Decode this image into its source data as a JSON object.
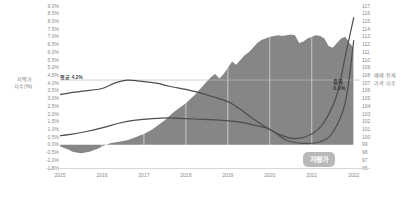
{
  "chart_data": {
    "type": "area",
    "title": "",
    "subtitle": "",
    "xlabel": "",
    "ylabel": "저평가 지수(%)",
    "y2label": "매매·전세\n가격·지수",
    "grid": true,
    "legend_position": "none",
    "x_tick_labels": [
      "2015",
      "2016",
      "2017",
      "2018",
      "2019",
      "2020",
      "2021",
      "2022"
    ],
    "ylim": [
      -1.5,
      9.0
    ],
    "y_tick_labels": [
      "9.0%",
      "8.5%",
      "8.0%",
      "7.5%",
      "7.0%",
      "6.5%",
      "6.0%",
      "5.5%",
      "5.0%",
      "4.5%",
      "4.0%",
      "3.5%",
      "3.0%",
      "2.5%",
      "2.0%",
      "1.5%",
      "1.0%",
      "0.5%",
      "0.0%",
      "-0.5%",
      "-1.0%",
      "-1.5%"
    ],
    "y_tick_values": [
      9.0,
      8.5,
      8.0,
      7.5,
      7.0,
      6.5,
      6.0,
      5.5,
      5.0,
      4.5,
      4.0,
      3.5,
      3.0,
      2.5,
      2.0,
      1.5,
      1.0,
      0.5,
      0.0,
      -0.5,
      -1.0,
      -1.5
    ],
    "y2lim": [
      96,
      117
    ],
    "y2_tick_labels": [
      "117",
      "116",
      "115",
      "114",
      "113",
      "112",
      "111",
      "110",
      "109",
      "108",
      "107",
      "106",
      "105",
      "104",
      "103",
      "102",
      "101",
      "100",
      "99",
      "98",
      "97",
      "96"
    ],
    "y2_tick_values": [
      117,
      116,
      115,
      114,
      113,
      112,
      111,
      110,
      109,
      108,
      107,
      106,
      105,
      104,
      103,
      102,
      101,
      100,
      99,
      98,
      97,
      96
    ],
    "annotations": [
      {
        "name": "average-line-label",
        "text": "평균 4.2%",
        "value": 4.2,
        "axis": "left"
      },
      {
        "name": "peak-label",
        "text": "중복 3.0%",
        "value": 3.0,
        "axis": "left"
      },
      {
        "name": "undervalued-badge",
        "text": "저평가"
      }
    ],
    "series": [
      {
        "name": "저평가 지수",
        "type": "area",
        "axis": "left",
        "color": "#808080",
        "x": [
          2015.0,
          2015.1,
          2015.2,
          2015.3,
          2015.4,
          2015.5,
          2015.6,
          2015.7,
          2015.8,
          2015.9,
          2016.0,
          2016.1,
          2016.2,
          2016.3,
          2016.4,
          2016.5,
          2016.6,
          2016.7,
          2016.8,
          2016.9,
          2017.0,
          2017.1,
          2017.2,
          2017.3,
          2017.4,
          2017.5,
          2017.6,
          2017.7,
          2017.8,
          2017.9,
          2018.0,
          2018.1,
          2018.2,
          2018.3,
          2018.4,
          2018.5,
          2018.6,
          2018.7,
          2018.8,
          2018.9,
          2019.0,
          2019.1,
          2019.2,
          2019.3,
          2019.4,
          2019.5,
          2019.6,
          2019.7,
          2019.8,
          2019.9,
          2020.0,
          2020.1,
          2020.2,
          2020.3,
          2020.4,
          2020.5,
          2020.6,
          2020.7,
          2020.8,
          2020.9,
          2021.0,
          2021.1,
          2021.2,
          2021.3,
          2021.4,
          2021.5,
          2021.6,
          2021.7,
          2021.8,
          2021.9,
          2022.0
        ],
        "values": [
          -0.1,
          -0.2,
          -0.3,
          -0.45,
          -0.5,
          -0.55,
          -0.5,
          -0.45,
          -0.35,
          -0.25,
          -0.1,
          0.0,
          0.1,
          0.15,
          0.2,
          0.25,
          0.3,
          0.4,
          0.5,
          0.6,
          0.7,
          0.85,
          1.0,
          1.2,
          1.4,
          1.6,
          1.85,
          2.1,
          2.3,
          2.5,
          2.7,
          2.95,
          3.2,
          3.5,
          3.8,
          4.1,
          4.4,
          4.6,
          4.3,
          4.6,
          5.0,
          5.4,
          5.2,
          5.5,
          5.8,
          6.0,
          6.3,
          6.6,
          6.8,
          6.9,
          7.0,
          7.05,
          7.1,
          7.05,
          7.1,
          7.15,
          7.1,
          6.6,
          6.7,
          6.9,
          7.0,
          7.1,
          7.05,
          6.9,
          6.4,
          6.3,
          6.6,
          6.9,
          7.0,
          6.6,
          6.3
        ]
      },
      {
        "name": "매매가격지수",
        "type": "line",
        "axis": "right",
        "color": "#4d4d4d",
        "x": [
          2015.0,
          2015.3,
          2015.6,
          2016.0,
          2016.3,
          2016.6,
          2017.0,
          2017.3,
          2017.6,
          2018.0,
          2018.3,
          2018.6,
          2019.0,
          2019.3,
          2019.6,
          2020.0,
          2020.3,
          2020.6,
          2021.0,
          2021.3,
          2021.6,
          2021.8,
          2022.0
        ],
        "values": [
          105.5,
          105.8,
          106.0,
          106.3,
          107.0,
          107.4,
          107.2,
          107.0,
          106.6,
          106.2,
          105.8,
          105.3,
          104.6,
          103.6,
          102.4,
          101.0,
          100.2,
          99.8,
          100.4,
          102.0,
          105.5,
          110.5,
          115.5
        ]
      },
      {
        "name": "전세가격지수",
        "type": "line",
        "axis": "right",
        "color": "#4d4d4d",
        "x": [
          2015.0,
          2015.3,
          2015.6,
          2016.0,
          2016.4,
          2016.8,
          2017.2,
          2017.6,
          2018.0,
          2018.4,
          2018.8,
          2019.2,
          2019.6,
          2020.0,
          2020.4,
          2020.8,
          2021.2,
          2021.5,
          2021.8,
          2022.0
        ],
        "values": [
          100.2,
          100.4,
          100.7,
          101.2,
          101.8,
          102.2,
          102.4,
          102.5,
          102.4,
          102.3,
          102.2,
          102.0,
          101.6,
          101.0,
          99.6,
          99.2,
          99.4,
          100.6,
          104.5,
          112.5
        ]
      }
    ]
  }
}
